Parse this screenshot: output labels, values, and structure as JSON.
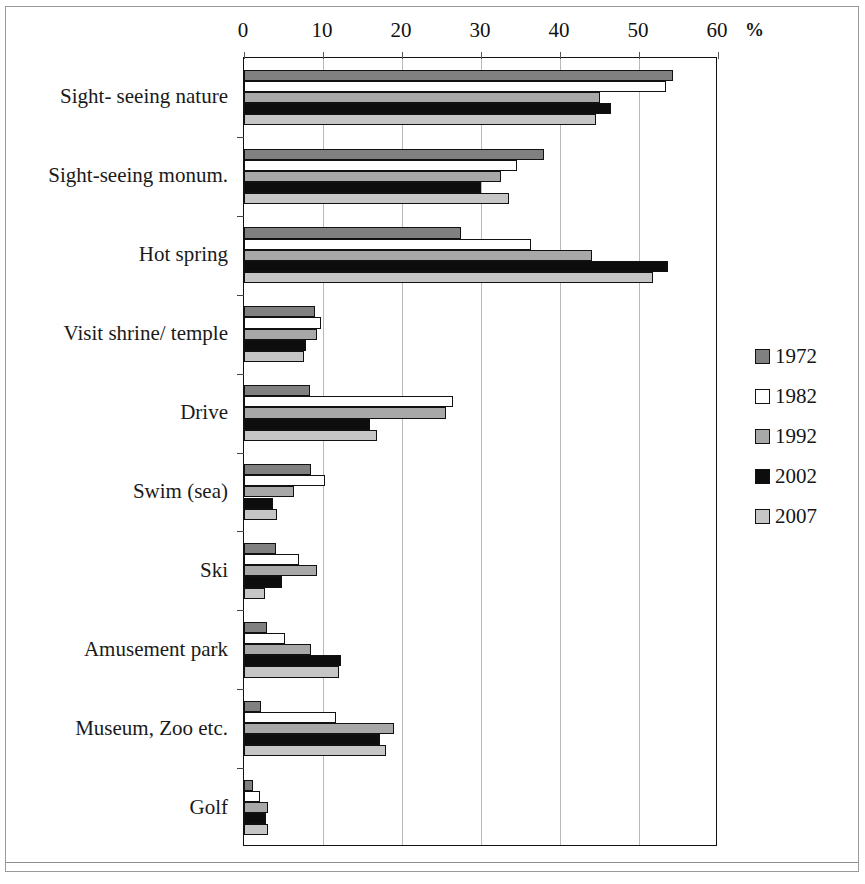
{
  "axis": {
    "unit_symbol": "%",
    "ticks": [
      "0",
      "10",
      "20",
      "30",
      "40",
      "50",
      "60"
    ],
    "tick_values": [
      0,
      10,
      20,
      30,
      40,
      50,
      60
    ]
  },
  "legend": {
    "position": "right",
    "entries": [
      {
        "label": "1972",
        "color": "#808080"
      },
      {
        "label": "1982",
        "color": "#ffffff"
      },
      {
        "label": "1992",
        "color": "#a8a8a8"
      },
      {
        "label": "2002",
        "color": "#0d0d0d"
      },
      {
        "label": "2007",
        "color": "#c6c6c6"
      }
    ]
  },
  "chart_data": {
    "type": "bar",
    "orientation": "horizontal",
    "title": "",
    "xlabel": "%",
    "ylabel": "",
    "xlim": [
      0,
      60
    ],
    "grid": true,
    "legend_position": "right",
    "categories": [
      "Sight- seeing nature",
      "Sight-seeing monum.",
      "Hot spring",
      "Visit shrine/ temple",
      "Drive",
      "Swim (sea)",
      "Ski",
      "Amusement  park",
      "Museum, Zoo etc.",
      "Golf"
    ],
    "series": [
      {
        "name": "1972",
        "color": "#808080",
        "values": [
          54.3,
          38.0,
          27.5,
          9.0,
          8.4,
          8.5,
          4.0,
          2.9,
          2.2,
          1.2
        ]
      },
      {
        "name": "1982",
        "color": "#ffffff",
        "values": [
          53.4,
          34.5,
          36.3,
          9.7,
          26.5,
          10.2,
          7.0,
          5.2,
          11.7,
          2.0
        ]
      },
      {
        "name": "1992",
        "color": "#a8a8a8",
        "values": [
          45.0,
          32.5,
          44.0,
          9.2,
          25.6,
          6.3,
          9.3,
          8.5,
          19.0,
          3.1
        ]
      },
      {
        "name": "2002",
        "color": "#0d0d0d",
        "values": [
          46.5,
          30.0,
          53.7,
          7.8,
          16.0,
          3.7,
          4.8,
          12.3,
          17.2,
          2.8
        ]
      },
      {
        "name": "2007",
        "color": "#c6c6c6",
        "values": [
          44.5,
          33.5,
          51.8,
          7.6,
          16.8,
          4.2,
          2.7,
          12.0,
          18.0,
          3.1
        ]
      }
    ]
  }
}
